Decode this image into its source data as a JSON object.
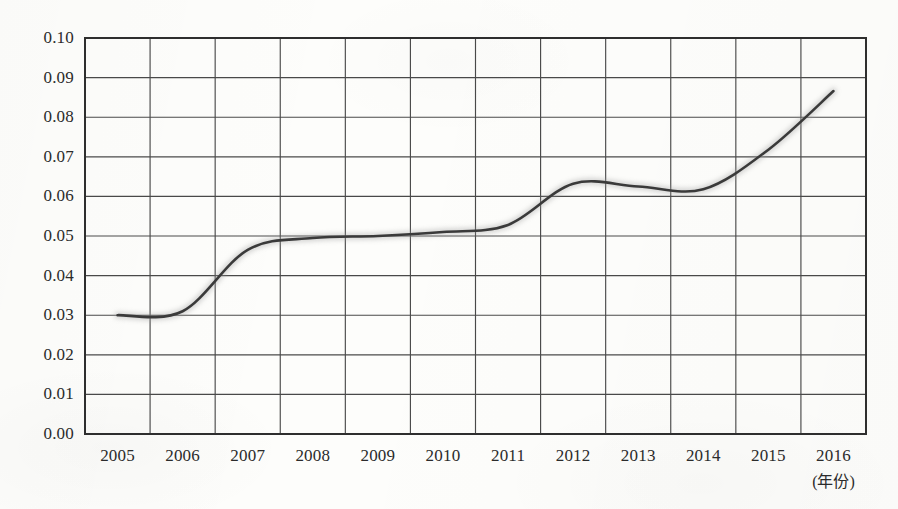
{
  "chart_data": {
    "type": "line",
    "title": "",
    "subtitle": "",
    "xlabel": "(年份)",
    "ylabel": "",
    "xlim": [
      2004.5,
      2016.5
    ],
    "ylim": [
      0.0,
      0.1
    ],
    "grid": true,
    "legend": null,
    "legend_position": "none",
    "x": [
      2005,
      2006,
      2007,
      2008,
      2009,
      2010,
      2011,
      2012,
      2013,
      2014,
      2015,
      2016
    ],
    "categories": [
      "2005",
      "2006",
      "2007",
      "2008",
      "2009",
      "2010",
      "2011",
      "2012",
      "2013",
      "2014",
      "2015",
      "2016"
    ],
    "values": [
      0.03,
      0.031,
      0.0465,
      0.0495,
      0.05,
      0.051,
      0.0528,
      0.0632,
      0.0625,
      0.0618,
      0.0718,
      0.0866
    ],
    "series": [
      {
        "name": "",
        "values": [
          0.03,
          0.031,
          0.0465,
          0.0495,
          0.05,
          0.051,
          0.0528,
          0.0632,
          0.0625,
          0.0618,
          0.0718,
          0.0866
        ]
      }
    ],
    "x_tick_labels": [
      "2005",
      "2006",
      "2007",
      "2008",
      "2009",
      "2010",
      "2011",
      "2012",
      "2013",
      "2014",
      "2015",
      "2016"
    ],
    "y_tick_labels": [
      "0.00",
      "0.01",
      "0.02",
      "0.03",
      "0.04",
      "0.05",
      "0.06",
      "0.07",
      "0.08",
      "0.09",
      "0.10"
    ],
    "y_tick_values": [
      0.0,
      0.01,
      0.02,
      0.03,
      0.04,
      0.05,
      0.06,
      0.07,
      0.08,
      0.09,
      0.1
    ],
    "colors": {
      "line": "#3a3a3a",
      "line_halo": "#9a9a9a",
      "grid": "#4a4a4a",
      "frame": "#2e2e2e",
      "background": "#fdfdfb",
      "text": "#2b2b2b"
    },
    "style_notes": "hand-drawn pencil line on scanned paper"
  }
}
